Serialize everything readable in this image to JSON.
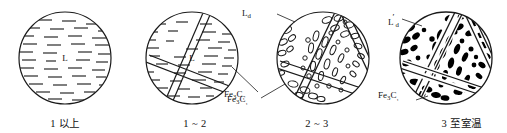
{
  "figure": {
    "background_color": "#ffffff",
    "line_color": "#1a1a1a",
    "fill_black": "#000000"
  },
  "stages": [
    {
      "id": "stage-1",
      "caption": "1 以上",
      "center_label": "L",
      "pattern": "dashes",
      "bands": 0,
      "leader_labels": []
    },
    {
      "id": "stage-2",
      "caption": "1 ~ 2",
      "center_label": "L",
      "pattern": "dashes-with-bands",
      "bands": 2,
      "leader_labels": [
        {
          "name": "cementite",
          "text_main": "Fe",
          "text_sub1": "3",
          "text_mid": "C",
          "text_sub2": "₁",
          "display": "Fe3C₁"
        }
      ]
    },
    {
      "id": "stage-3",
      "caption": "2 ~ 3",
      "center_label": "",
      "pattern": "open-ellipses",
      "bands": 3,
      "leader_labels": [
        {
          "name": "ledeburite",
          "text_main": "L",
          "text_sub1": "d",
          "prime": "",
          "display": "Ld"
        },
        {
          "name": "cementite",
          "text_main": "Fe",
          "text_sub1": "3",
          "text_mid": "C",
          "text_sub2": "₁",
          "display": "Fe3C₁"
        }
      ]
    },
    {
      "id": "stage-4",
      "caption": "3 至室温",
      "center_label": "",
      "pattern": "filled-ellipses",
      "bands": 3,
      "leader_labels": [
        {
          "name": "transformed-ledeburite",
          "text_main": "L",
          "prime": "′",
          "text_sub1": "d",
          "display": "L′d"
        },
        {
          "name": "cementite",
          "text_main": "Fe",
          "text_sub1": "3",
          "text_mid": "C",
          "text_sub2": "₁",
          "display": "Fe3C₁"
        }
      ]
    }
  ]
}
